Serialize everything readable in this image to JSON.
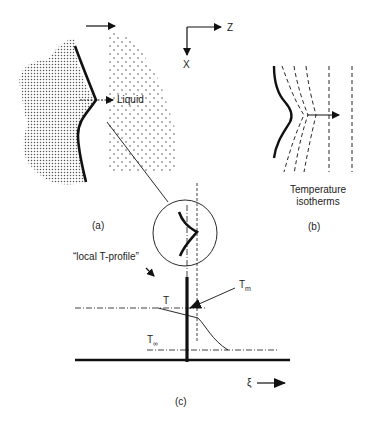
{
  "figure": {
    "panel_a": {
      "label": "(a)",
      "liquid_label": "Liquid"
    },
    "axes": {
      "z_label": "Z",
      "x_label": "X"
    },
    "panel_b": {
      "label": "(b)",
      "caption_line1": "Temperature",
      "caption_line2": "isotherms"
    },
    "panel_c": {
      "label": "(c)",
      "profile_label": "“local T-profile”",
      "t_label": "T",
      "tm_label": "T",
      "tm_sub": "m",
      "tinf_label": "T",
      "tinf_sub": "∞",
      "xi_label": "ξ"
    }
  }
}
